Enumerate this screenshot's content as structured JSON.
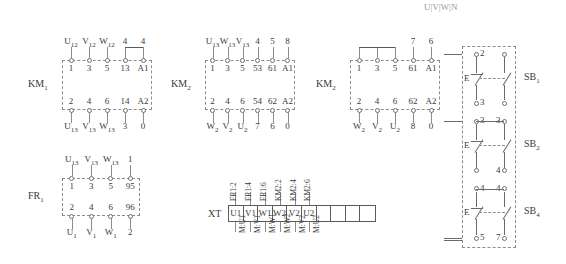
{
  "diagram": {
    "corner_mark": "U|V|W|N",
    "blocks": [
      {
        "id": "km1",
        "label": "KM",
        "label_sub": "1",
        "x": 62,
        "y": 60,
        "w": 90,
        "h": 50,
        "top_outer": [
          "U12",
          "V12",
          "W12",
          "4",
          "4"
        ],
        "top_inner": [
          "1",
          "3",
          "5",
          "13",
          "A1"
        ],
        "bottom_inner": [
          "2",
          "4",
          "6",
          "14",
          "A2"
        ],
        "bottom_outer": [
          "U13",
          "V13",
          "W13",
          "3",
          "0"
        ],
        "outer_subscripts_top": [
          true,
          true,
          true,
          false,
          false
        ],
        "outer_subscripts_bottom": [
          true,
          true,
          true,
          false,
          false
        ],
        "jumpers": [
          [
            3,
            4
          ]
        ]
      },
      {
        "id": "km2",
        "label": "KM",
        "label_sub": "2",
        "x": 205,
        "y": 60,
        "w": 90,
        "h": 50,
        "top_outer": [
          "U13",
          "W13",
          "V13",
          "4",
          "5",
          "8"
        ],
        "top_inner": [
          "1",
          "3",
          "5",
          "53",
          "61",
          "A1"
        ],
        "bottom_inner": [
          "2",
          "4",
          "6",
          "54",
          "62",
          "A2"
        ],
        "bottom_outer": [
          "W2",
          "V2",
          "U2",
          "7",
          "6",
          "0"
        ],
        "outer_subscripts_top": [
          true,
          true,
          true,
          false,
          false,
          false
        ],
        "outer_subscripts_bottom": [
          true,
          true,
          true,
          false,
          false,
          false
        ],
        "jumpers": []
      },
      {
        "id": "km3",
        "label": "KM",
        "label_sub": "2",
        "x": 350,
        "y": 60,
        "w": 90,
        "h": 50,
        "top_outer": [
          "",
          "",
          "",
          "7",
          "6"
        ],
        "top_inner": [
          "1",
          "3",
          "5",
          "61",
          "A1"
        ],
        "bottom_inner": [
          "2",
          "4",
          "6",
          "62",
          "A2"
        ],
        "bottom_outer": [
          "W2",
          "V2",
          "U2",
          "8",
          "0"
        ],
        "outer_subscripts_top": [
          false,
          false,
          false,
          false,
          false
        ],
        "outer_subscripts_bottom": [
          true,
          true,
          true,
          false,
          false
        ],
        "jumpers": [
          [
            0,
            1
          ],
          [
            1,
            2
          ]
        ]
      },
      {
        "id": "fr1",
        "label": "FR",
        "label_sub": "1",
        "x": 62,
        "y": 178,
        "w": 78,
        "h": 38,
        "top_outer": [
          "U13",
          "V13",
          "W13",
          "1"
        ],
        "top_inner": [
          "1",
          "3",
          "5",
          "95"
        ],
        "bottom_inner": [
          "2",
          "4",
          "6",
          "96"
        ],
        "bottom_outer": [
          "U1",
          "V1",
          "W1",
          "2"
        ],
        "outer_subscripts_top": [
          true,
          true,
          true,
          false
        ],
        "outer_subscripts_bottom": [
          true,
          true,
          true,
          false
        ],
        "jumpers": []
      }
    ],
    "xt": {
      "caption": "XT",
      "x": 228,
      "y": 205,
      "w": 148,
      "h": 17,
      "cells": [
        "U1",
        "V1",
        "W1",
        "W2",
        "V2",
        "U2",
        "",
        "",
        "",
        ""
      ],
      "top_labels": [
        "FR1:2",
        "FR1:4",
        "FR1:6",
        "KM2:2",
        "KM2:4",
        "KM2:6"
      ],
      "bottom_labels": [
        "M:U1",
        "M:V1",
        "M:W1",
        "M:W2",
        "M:V2",
        "M:U2"
      ]
    },
    "sb_panel": {
      "x": 462,
      "y": 46,
      "w": 54,
      "h": 202,
      "buttons": [
        {
          "label": "SB",
          "label_sub": "1",
          "top_left_num": "2",
          "bottom_left_num": "3",
          "bottom_right_num": "",
          "e_glyph": "E"
        },
        {
          "label": "SB",
          "label_sub": "2",
          "top_left_num": "3",
          "top_right_num": "3",
          "bottom_left_num": "",
          "bottom_right_num": "4",
          "e_glyph": "E"
        },
        {
          "label": "SB",
          "label_sub": "4",
          "top_left_num": "4",
          "top_right_num": "4",
          "bottom_left_num": "5",
          "bottom_right_num": "7",
          "e_glyph": "E"
        }
      ]
    }
  }
}
